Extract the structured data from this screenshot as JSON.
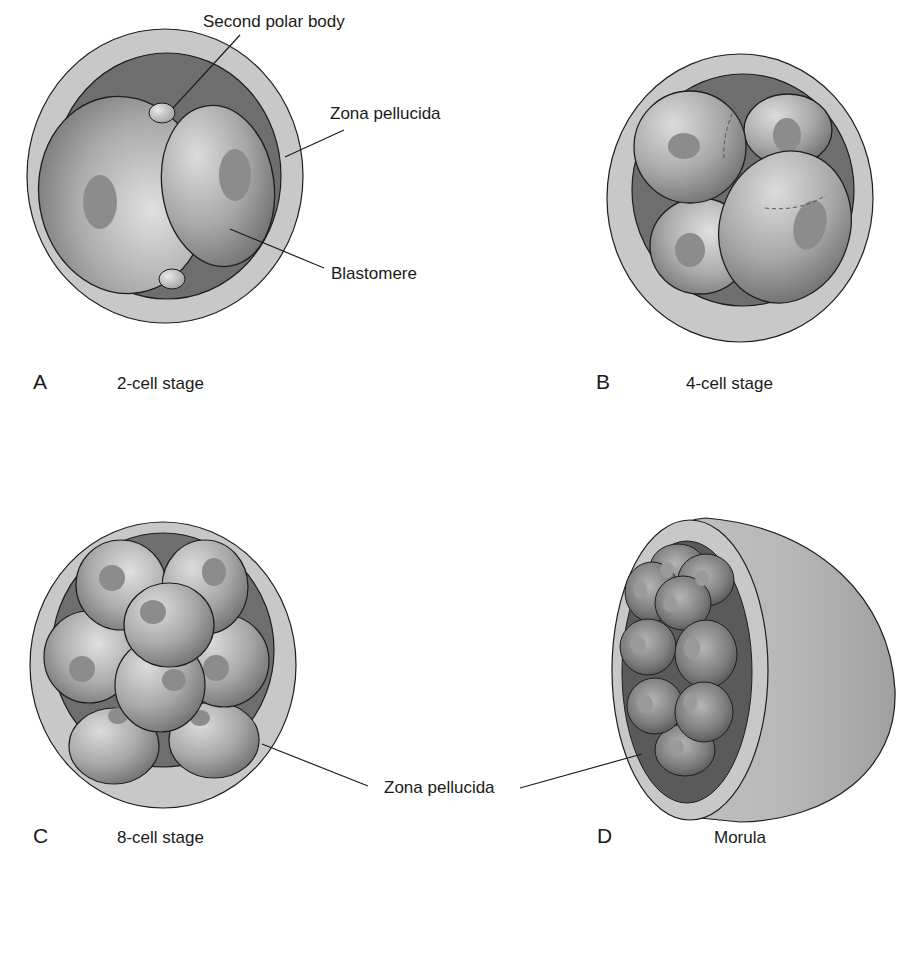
{
  "panels": [
    {
      "letter": "A",
      "caption": "2-cell stage"
    },
    {
      "letter": "B",
      "caption": "4-cell stage"
    },
    {
      "letter": "C",
      "caption": "8-cell stage"
    },
    {
      "letter": "D",
      "caption": "Morula"
    }
  ],
  "labels": {
    "second_polar_body": "Second polar body",
    "zona_pellucida_top": "Zona pellucida",
    "blastomere": "Blastomere",
    "zona_pellucida_bottom": "Zona pellucida"
  },
  "colors": {
    "zona": "#c8c8c8",
    "perivitelline": "#6e6e6e",
    "cell_light": "#d2d2d2",
    "cell_dark": "#7a7a7a",
    "nucleus": "#8a8a8a",
    "outline": "#1e1e1e"
  }
}
